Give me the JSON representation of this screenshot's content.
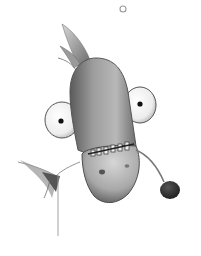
{
  "image": {
    "description": "Pencil illustration of an upside-down cartoon fish creature with bulging eyes, toothy mouth, a lure antenna ending in a dark ball, a tail fin on top, a small fin to the left, and an air bubble above",
    "width": 201,
    "height": 256,
    "palette": {
      "background": "#ffffff",
      "body_light": "#cfcfcf",
      "body_mid": "#9a9a9a",
      "body_dark": "#4a4a4a",
      "eye_white": "#f2f2f2",
      "pupil": "#111111",
      "lure_ball": "#2e2e2e",
      "tooth": "#eeeeee"
    },
    "elements": [
      "bubble",
      "tail-fin",
      "body",
      "left-eye",
      "right-eye",
      "teeth",
      "snout",
      "nostrils",
      "side-fin",
      "lure-antenna",
      "lure-ball"
    ]
  }
}
